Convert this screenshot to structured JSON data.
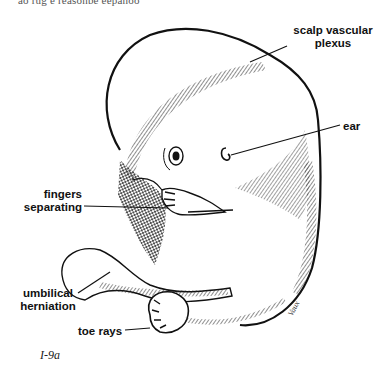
{
  "figure": {
    "top_cut_text": "ao rug e reasonbe eepanoo",
    "caption": "I-9a",
    "signature": "Vaux",
    "labels": {
      "scalp_line1": "scalp vascular",
      "scalp_line2": "plexus",
      "ear": "ear",
      "fingers_line1": "fingers",
      "fingers_line2": "separating",
      "umbilical_line1": "umbilical",
      "umbilical_line2": "herniation",
      "toe_rays": "toe rays"
    }
  }
}
